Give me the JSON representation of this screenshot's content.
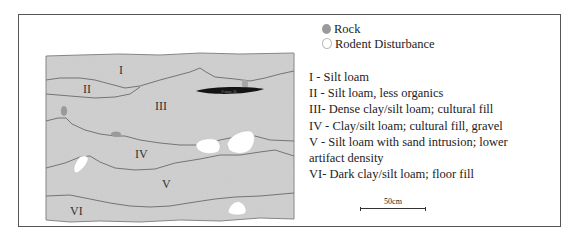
{
  "legend": {
    "symbols": [
      {
        "label": "Rock",
        "color": "#9a9a9a"
      },
      {
        "label": "Rodent Disturbance",
        "color": "#ffffff"
      }
    ],
    "layers": [
      "I - Silt loam",
      "II - Silt loam, less organics",
      "III- Dense clay/silt loam; cultural fill",
      "IV - Clay/silt loam; cultural fill, gravel",
      "V - Silt loam with sand intrusion; lower",
      "artifact density",
      "VI- Dark clay/silt loam; floor fill"
    ]
  },
  "profile": {
    "layer_labels": [
      "I",
      "II",
      "III",
      "IV",
      "V",
      "VI"
    ],
    "feature_label": "Feature 36",
    "fill_color": "#cfcfcf",
    "line_color": "#6a6a6a"
  },
  "scale": {
    "label": "50cm"
  }
}
